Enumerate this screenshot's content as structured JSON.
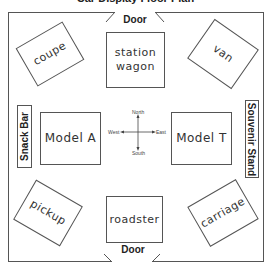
{
  "title": "Car Display Floor Plan",
  "doors": {
    "top": "Door",
    "bottom": "Door"
  },
  "side_labels": {
    "west": "Snack Bar",
    "east": "Souvenir Stand"
  },
  "cars": {
    "top_left": "coupe",
    "top_center_line1": "station",
    "top_center_line2": "wagon",
    "top_right": "van",
    "middle_left": "Model A",
    "middle_right": "Model T",
    "bottom_left": "pickup",
    "bottom_center": "roadster",
    "bottom_right": "carriage"
  },
  "compass": {
    "north": "North",
    "south": "South",
    "east": "East",
    "west": "West"
  },
  "colors": {
    "line": "#555555",
    "text": "#222222",
    "background": "#ffffff"
  }
}
